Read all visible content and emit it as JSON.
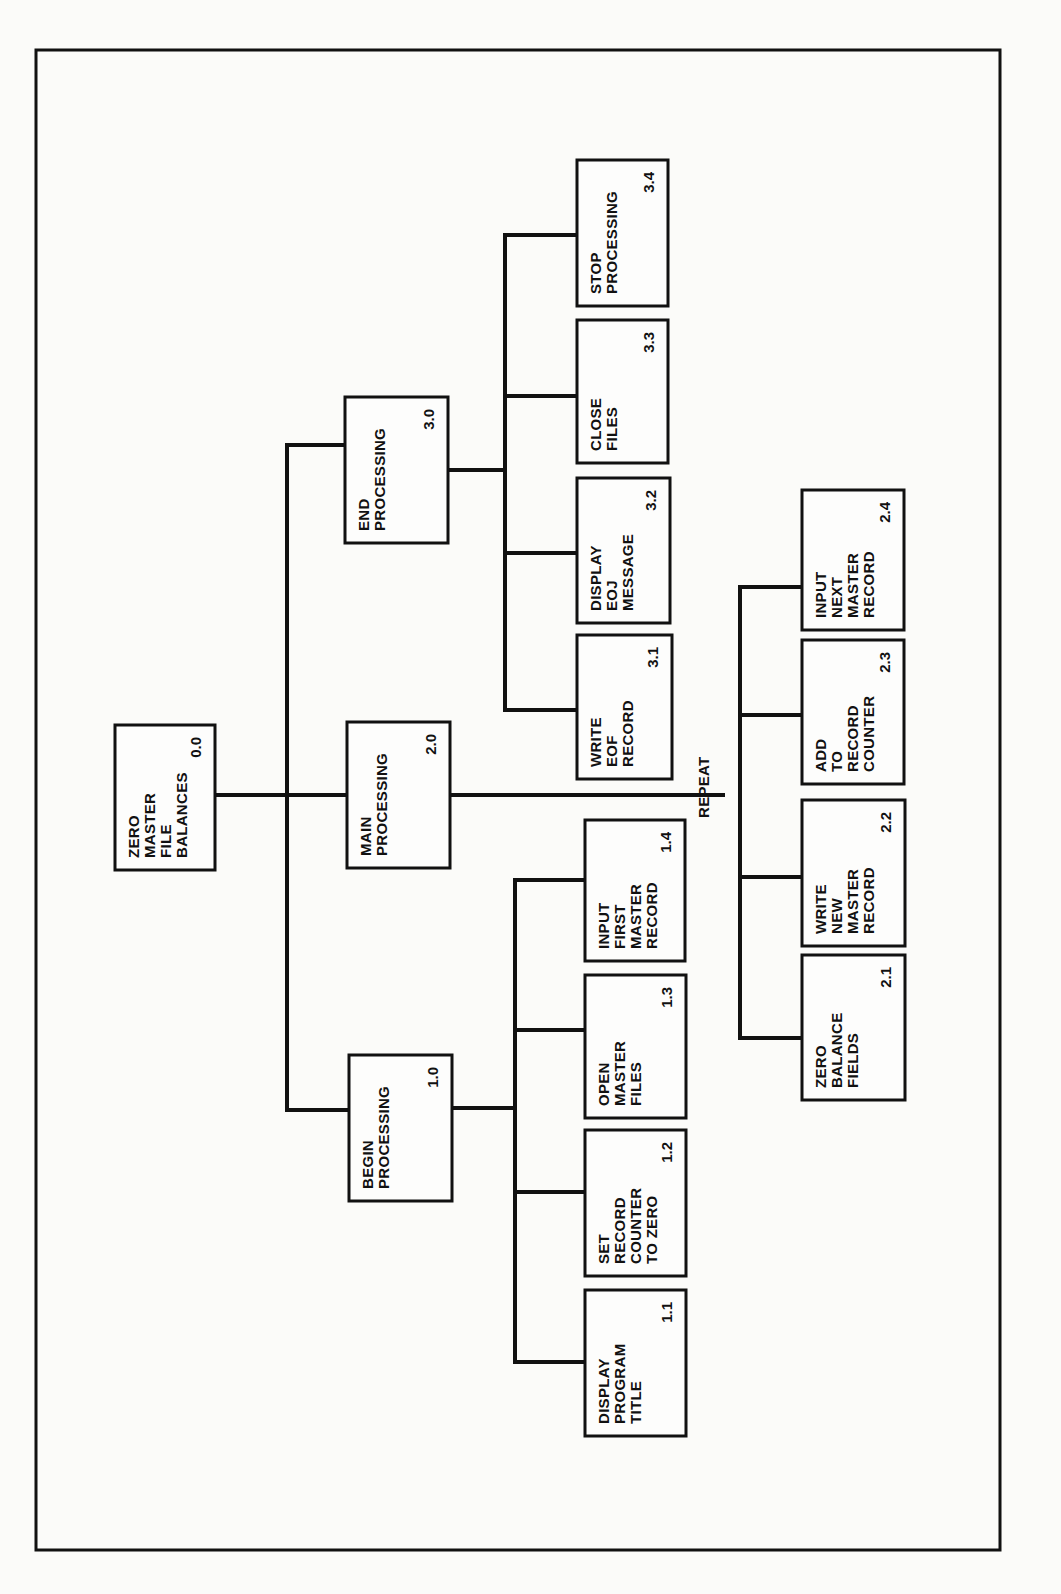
{
  "chart_title": "",
  "orientation": "rotated-90-ccw",
  "root": {
    "id": "0.0",
    "lines": [
      "ZERO",
      "MASTER",
      "FILE",
      "BALANCES"
    ]
  },
  "modules": [
    {
      "id": "1.0",
      "lines": [
        "BEGIN",
        "PROCESSING"
      ],
      "children": [
        {
          "id": "1.1",
          "lines": [
            "DISPLAY",
            "PROGRAM",
            "TITLE"
          ]
        },
        {
          "id": "1.2",
          "lines": [
            "SET",
            "RECORD",
            "COUNTER",
            "TO ZERO"
          ]
        },
        {
          "id": "1.3",
          "lines": [
            "OPEN",
            "MASTER",
            "FILES"
          ]
        },
        {
          "id": "1.4",
          "lines": [
            "INPUT",
            "FIRST",
            "MASTER",
            "RECORD"
          ]
        }
      ]
    },
    {
      "id": "2.0",
      "lines": [
        "MAIN",
        "PROCESSING"
      ],
      "loop_label": "REPEAT",
      "children": [
        {
          "id": "2.1",
          "lines": [
            "ZERO",
            "BALANCE",
            "FIELDS"
          ]
        },
        {
          "id": "2.2",
          "lines": [
            "WRITE",
            "NEW",
            "MASTER",
            "RECORD"
          ]
        },
        {
          "id": "2.3",
          "lines": [
            "ADD",
            "TO",
            "RECORD",
            "COUNTER"
          ]
        },
        {
          "id": "2.4",
          "lines": [
            "INPUT",
            "NEXT",
            "MASTER",
            "RECORD"
          ]
        }
      ]
    },
    {
      "id": "3.0",
      "lines": [
        "END",
        "PROCESSING"
      ],
      "children": [
        {
          "id": "3.1",
          "lines": [
            "WRITE",
            "EOF",
            "RECORD"
          ]
        },
        {
          "id": "3.2",
          "lines": [
            "DISPLAY",
            "EOJ",
            "MESSAGE"
          ]
        },
        {
          "id": "3.3",
          "lines": [
            "CLOSE",
            "FILES"
          ]
        },
        {
          "id": "3.4",
          "lines": [
            "STOP",
            "PROCESSING"
          ]
        }
      ]
    }
  ]
}
